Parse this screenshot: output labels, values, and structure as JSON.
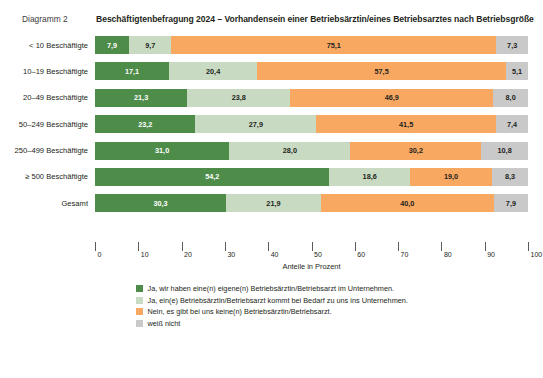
{
  "header": {
    "diagram_number": "Diagramm 2",
    "title": "Beschäftigtenbefragung 2024 – Vorhandensein einer Betriebsärztin/eines Betriebsarztes nach Betriebsgröße"
  },
  "axis": {
    "xlabel": "Anteile in Prozent",
    "ticks": [
      "0",
      "10",
      "20",
      "30",
      "40",
      "50",
      "60",
      "70",
      "80",
      "90",
      "100"
    ]
  },
  "legend": {
    "items": [
      {
        "label": "Ja, wir haben eine(n) eigene(n) Betriebsärztin/Betriebsarzt im Unternehmen.",
        "color": "#4e8c4a"
      },
      {
        "label": "Ja, ein(e) Betriebsärztin/Betriebsarzt kommt bei Bedarf zu uns ins Unternehmen.",
        "color": "#c8dbc2"
      },
      {
        "label": "Nein, es gibt bei uns keine(n) Betriebsärztin/Betriebsarzt.",
        "color": "#f9a861"
      },
      {
        "label": "weiß nicht",
        "color": "#c9c9c9"
      }
    ]
  },
  "chart_data": {
    "type": "bar",
    "orientation": "horizontal",
    "stacked": true,
    "title": "Beschäftigtenbefragung 2024 – Vorhandensein einer Betriebsärztin/eines Betriebsarztes nach Betriebsgröße",
    "xlabel": "Anteile in Prozent",
    "ylabel": "",
    "xlim": [
      0,
      100
    ],
    "grid": false,
    "legend_position": "bottom",
    "categories": [
      "< 10 Beschäftigte",
      "10–19 Beschäftigte",
      "20–49 Beschäftigte",
      "50–249 Beschäftigte",
      "250–499 Beschäftigte",
      "≥ 500 Beschäftigte",
      "Gesamt"
    ],
    "series": [
      {
        "name": "Ja, wir haben eine(n) eigene(n) Betriebsärztin/Betriebsarzt im Unternehmen.",
        "color": "#4e8c4a",
        "values": [
          7.9,
          17.1,
          21.3,
          23.2,
          31.0,
          54.2,
          30.3
        ],
        "labels": [
          "7,9",
          "17,1",
          "21,3",
          "23,2",
          "31,0",
          "54,2",
          "30,3"
        ]
      },
      {
        "name": "Ja, ein(e) Betriebsärztin/Betriebsarzt kommt bei Bedarf zu uns ins Unternehmen.",
        "color": "#c8dbc2",
        "values": [
          9.7,
          20.4,
          23.8,
          27.9,
          28.0,
          18.6,
          21.9
        ],
        "labels": [
          "9,7",
          "20,4",
          "23,8",
          "27,9",
          "28,0",
          "18,6",
          "21,9"
        ]
      },
      {
        "name": "Nein, es gibt bei uns keine(n) Betriebsärztin/Betriebsarzt.",
        "color": "#f9a861",
        "values": [
          75.1,
          57.5,
          46.9,
          41.5,
          30.2,
          19.0,
          40.0
        ],
        "labels": [
          "75,1",
          "57,5",
          "46,9",
          "41,5",
          "30,2",
          "19,0",
          "40,0"
        ]
      },
      {
        "name": "weiß nicht",
        "color": "#c9c9c9",
        "values": [
          7.3,
          5.1,
          8.0,
          7.4,
          10.8,
          8.3,
          7.9
        ],
        "labels": [
          "7,3",
          "5,1",
          "8,0",
          "7,4",
          "10,8",
          "8,3",
          "7,9"
        ]
      }
    ]
  }
}
